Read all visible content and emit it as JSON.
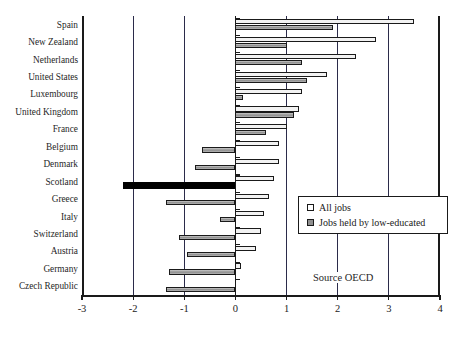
{
  "chart_data": {
    "type": "bar",
    "orientation": "horizontal",
    "title": "",
    "xlabel": "",
    "ylabel": "",
    "xlim": [
      -3,
      4
    ],
    "xticks": [
      "-3",
      "-2",
      "-1",
      "0",
      "1",
      "2",
      "3",
      "4"
    ],
    "xtick_values": [
      -3,
      -2,
      -1,
      0,
      1,
      2,
      3,
      4
    ],
    "grid": true,
    "gridlines_at": [
      -2,
      -1,
      0,
      1,
      2,
      3
    ],
    "legend_position": "center-right",
    "annotation": "Source OECD",
    "categories": [
      "Spain",
      "New Zealand",
      "Netherlands",
      "United States",
      "Luxembourg",
      "United Kingdom",
      "France",
      "Belgium",
      "Denmark",
      "Scotland",
      "Greece",
      "Italy",
      "Switzerland",
      "Austria",
      "Germany",
      "Czech Republic"
    ],
    "series": [
      {
        "name": "All jobs",
        "color": "#f2f2f2",
        "values": [
          3.5,
          2.75,
          2.35,
          1.8,
          1.3,
          1.25,
          1.0,
          0.85,
          0.85,
          0.75,
          0.65,
          0.55,
          0.5,
          0.4,
          0.1,
          0.0
        ]
      },
      {
        "name": "Jobs held by low-educated",
        "color": "#8f8f8f",
        "values": [
          1.9,
          1.0,
          1.3,
          1.4,
          0.15,
          1.15,
          0.6,
          -0.65,
          -0.8,
          -2.2,
          -1.35,
          -0.3,
          -1.1,
          -0.95,
          -1.3,
          -1.35
        ],
        "highlight_index": 9,
        "highlight_color": "#000000"
      }
    ]
  },
  "legend": {
    "items": [
      {
        "label": "All jobs",
        "swatch": "all"
      },
      {
        "label": "Jobs held by low-educated",
        "swatch": "low"
      }
    ]
  },
  "source_note": "Source OECD"
}
